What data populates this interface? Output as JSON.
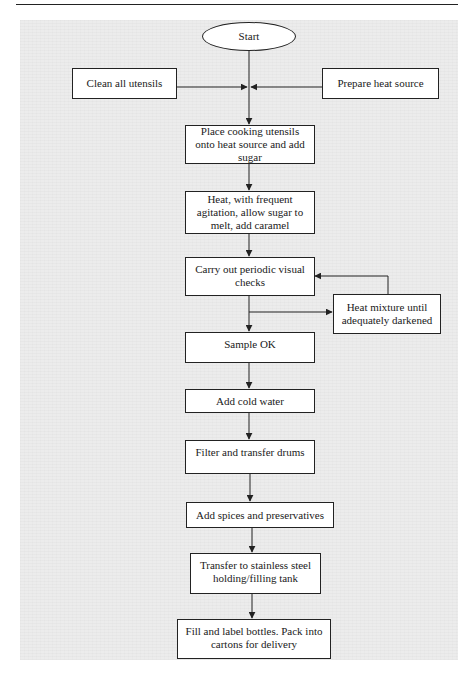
{
  "diagram": {
    "type": "flowchart",
    "colors": {
      "page_background": "#ffffff",
      "panel_background": "#ececec",
      "box_fill": "#ffffff",
      "line": "#222222",
      "text": "#1a1a1a"
    },
    "nodes": {
      "start": "Start",
      "clean_utensils": "Clean all utensils",
      "prepare_heat": "Prepare heat source",
      "place_utensils": "Place cooking utensils onto heat source and add sugar",
      "heat_agitate": "Heat, with frequent agitation, allow sugar to melt, add caramel",
      "visual_checks": "Carry out periodic visual checks",
      "heat_mixture": "Heat mixture until adequately darkened",
      "sample_ok": "Sample OK",
      "add_water": "Add cold water",
      "filter_transfer": "Filter and transfer drums",
      "add_spices": "Add spices and preservatives",
      "transfer_tank": "Transfer to stainless steel holding/filling tank",
      "fill_label": "Fill and label bottles. Pack into cartons for delivery"
    },
    "edges": [
      {
        "from": "start",
        "to": "place_utensils"
      },
      {
        "from": "clean_utensils",
        "to": "place_utensils"
      },
      {
        "from": "prepare_heat",
        "to": "place_utensils"
      },
      {
        "from": "place_utensils",
        "to": "heat_agitate"
      },
      {
        "from": "heat_agitate",
        "to": "visual_checks"
      },
      {
        "from": "visual_checks",
        "to": "heat_mixture"
      },
      {
        "from": "heat_mixture",
        "to": "visual_checks"
      },
      {
        "from": "visual_checks",
        "to": "sample_ok"
      },
      {
        "from": "sample_ok",
        "to": "add_water"
      },
      {
        "from": "add_water",
        "to": "filter_transfer"
      },
      {
        "from": "filter_transfer",
        "to": "add_spices"
      },
      {
        "from": "add_spices",
        "to": "transfer_tank"
      },
      {
        "from": "transfer_tank",
        "to": "fill_label"
      }
    ]
  }
}
